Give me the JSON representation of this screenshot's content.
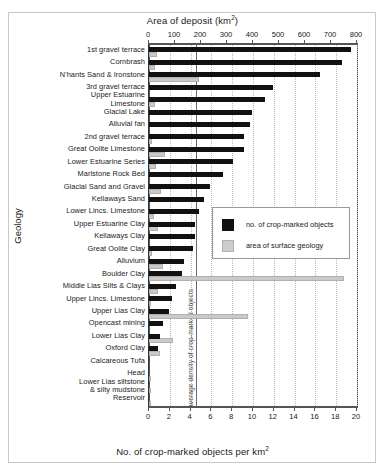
{
  "chart_data": {
    "type": "bar",
    "title": "",
    "orientation": "horizontal",
    "top_axis": {
      "label": "Area of deposit (km2)",
      "label_text": "Area of deposit (km",
      "label_sup": "2",
      "label_tail": ")",
      "min": 0,
      "max": 800,
      "ticks": [
        0,
        100,
        200,
        300,
        400,
        500,
        600,
        700,
        800
      ],
      "applies_to": "area of surface geology"
    },
    "bottom_axis": {
      "label": "No. of crop-marked objects per km2",
      "label_text": "No. of crop-marked objects per km",
      "label_sup": "2",
      "min": 0,
      "max": 20,
      "ticks": [
        0,
        2,
        4,
        6,
        8,
        10,
        12,
        14,
        16,
        18,
        20
      ],
      "applies_to": "no. of crop-marked objects"
    },
    "ylabel": "Geology",
    "grid": "vertical-dotted",
    "legend_position": "center-right",
    "annotation": {
      "text": "average density of crop-marked objects",
      "value": 4.5,
      "axis": "bottom"
    },
    "series": [
      {
        "name": "no. of crop-marked objects",
        "color": "#111111",
        "unit": "per km2",
        "axis": "bottom"
      },
      {
        "name": "area of surface geology",
        "color": "#c9c9c9",
        "unit": "km2",
        "axis": "top"
      }
    ],
    "categories": [
      "1st gravel terrace",
      "Cornbrash",
      "N'hants Sand & Ironstone",
      "3rd gravel terrace",
      "Upper Estuarine\nLimestone",
      "Glacial Lake",
      "Alluvial fan",
      "2nd gravel terrace",
      "Great Oolite Limestone",
      "Lower Estuarine Series",
      "Marlstone Rock Bed",
      "Glacial Sand and Gravel",
      "Kellaways Sand",
      "Lower Lincs. Limestone",
      "Upper Estuarine Clay",
      "Kellaways Clay",
      "Great Oolite Clay",
      "Alluvium",
      "Boulder Clay",
      "Middle Lias Silts & Clays",
      "Upper Lincs. Limestone",
      "Upper Lias Clay",
      "Opencast mining",
      "Lower Lias Clay",
      "Oxford Clay",
      "Calcareous Tufa",
      "Head",
      "Lower Lias siltstone\n& silty mudstone",
      "Reservoir"
    ],
    "density_values": [
      19.4,
      18.6,
      16.4,
      11.9,
      11.2,
      9.9,
      9.7,
      9.1,
      9.1,
      8.1,
      7.1,
      5.9,
      5.3,
      4.8,
      4.4,
      4.4,
      4.2,
      3.4,
      3.2,
      2.6,
      2.2,
      1.9,
      1.3,
      1.1,
      0.9,
      0.0,
      0.0,
      0.0,
      0.0
    ],
    "area_values": [
      30,
      22,
      192,
      0,
      24,
      0,
      0,
      12,
      63,
      28,
      0,
      45,
      0,
      20,
      36,
      0,
      10,
      52,
      750,
      34,
      4,
      382,
      0,
      92,
      44,
      0,
      2,
      2,
      2
    ]
  },
  "legend": {
    "items": [
      {
        "label": "no. of crop-marked objects",
        "swatch": "black"
      },
      {
        "label": "area of surface geology",
        "swatch": "gray"
      }
    ]
  }
}
